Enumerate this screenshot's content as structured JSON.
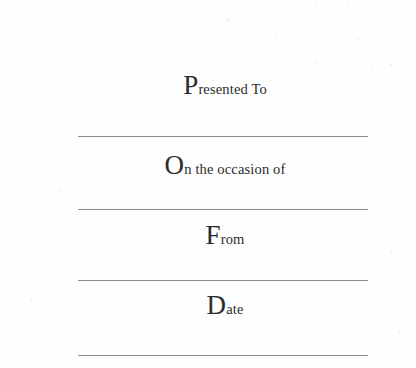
{
  "page": {
    "background_color": "#fefefe",
    "ink_color": "#2b2b2b",
    "rule_color": "#8d8d8d"
  },
  "fields": [
    {
      "name": "presented-to",
      "initial": "P",
      "rest": "resented To",
      "full_text": "Presented To",
      "value": ""
    },
    {
      "name": "on-the-occasion-of",
      "initial": "O",
      "rest": "n the occasion of",
      "full_text": "On the occasion of",
      "value": ""
    },
    {
      "name": "from",
      "initial": "F",
      "rest": "rom",
      "full_text": "From",
      "value": ""
    },
    {
      "name": "date",
      "initial": "D",
      "rest": "ate",
      "full_text": "Date",
      "value": ""
    }
  ]
}
